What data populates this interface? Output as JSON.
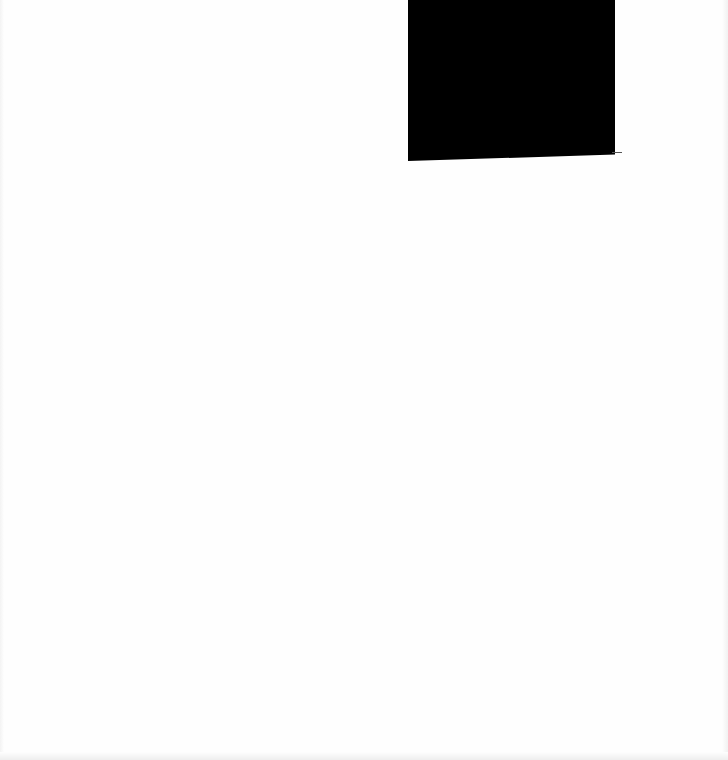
{
  "document": {
    "type": "scanned-page",
    "background_color": "#fefefe",
    "text_content": "",
    "redactions": [
      {
        "color": "#000000",
        "x": 408,
        "y": 0,
        "width": 207,
        "height": 161
      }
    ]
  }
}
